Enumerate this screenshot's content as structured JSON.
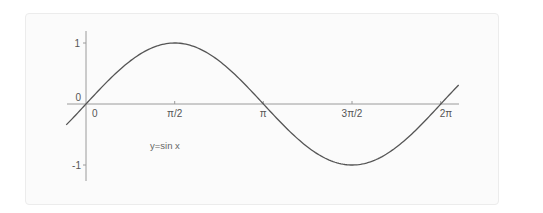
{
  "chart_data": {
    "type": "line",
    "title": "",
    "xlabel": "",
    "ylabel": "",
    "annotation": "y=sin x",
    "function": "sin(x)",
    "x_range": [
      -0.35,
      6.6
    ],
    "ylim": [
      -1.25,
      1.25
    ],
    "grid": false,
    "legend": null,
    "x_ticks": [
      {
        "value": 0,
        "label": "0"
      },
      {
        "value": 1.5708,
        "label": "π/2"
      },
      {
        "value": 3.1416,
        "label": "π"
      },
      {
        "value": 4.7124,
        "label": "3π/2"
      },
      {
        "value": 6.2832,
        "label": "2π"
      }
    ],
    "y_ticks": [
      {
        "value": 1,
        "label": "1"
      },
      {
        "value": 0,
        "label": "0"
      },
      {
        "value": -1,
        "label": "-1"
      }
    ],
    "series": [
      {
        "name": "y=sin x",
        "x": [
          0,
          0.7854,
          1.5708,
          2.3562,
          3.1416,
          3.927,
          4.7124,
          5.4978,
          6.2832
        ],
        "values": [
          0,
          0.707,
          1,
          0.707,
          0,
          -0.707,
          -1,
          -0.707,
          0
        ],
        "color": "#555555"
      }
    ]
  },
  "labels": {
    "x0": "0",
    "xpi2": "π/2",
    "xpi": "π",
    "x3pi2": "3π/2",
    "x2pi": "2π",
    "y1": "1",
    "y0": "0",
    "yneg1": "-1",
    "annotation": "y=sin x"
  },
  "colors": {
    "axis": "#9a9a9a",
    "curve": "#555555",
    "card_bg": "#fbfbfb"
  }
}
